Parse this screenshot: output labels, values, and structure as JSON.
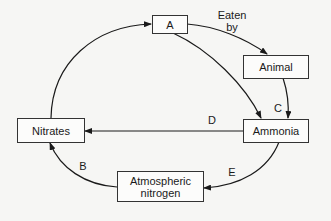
{
  "diagram": {
    "type": "cycle",
    "nodes": {
      "a": {
        "label": "A"
      },
      "animal": {
        "label": "Animal"
      },
      "ammonia": {
        "label": "Ammonia"
      },
      "nitrates": {
        "label": "Nitrates"
      },
      "atmospheric_nitrogen": {
        "label_line1": "Atmospheric",
        "label_line2": "nitrogen"
      }
    },
    "edge_labels": {
      "eaten_by_line1": "Eaten",
      "eaten_by_line2": "by",
      "b": "B",
      "c": "C",
      "d": "D",
      "e": "E"
    },
    "edges": [
      {
        "from": "Nitrates",
        "to": "A",
        "label": ""
      },
      {
        "from": "A",
        "to": "Animal",
        "label": "Eaten by"
      },
      {
        "from": "A",
        "to": "Ammonia",
        "label": ""
      },
      {
        "from": "Animal",
        "to": "Ammonia",
        "label": "C"
      },
      {
        "from": "Ammonia",
        "to": "Nitrates",
        "label": "D"
      },
      {
        "from": "Ammonia",
        "to": "Atmospheric nitrogen",
        "label": "E"
      },
      {
        "from": "Atmospheric nitrogen",
        "to": "Nitrates",
        "label": "B"
      }
    ],
    "colors": {
      "line": "#1a1a1a",
      "box_border": "#333333",
      "background": "#f6f6f4"
    }
  }
}
